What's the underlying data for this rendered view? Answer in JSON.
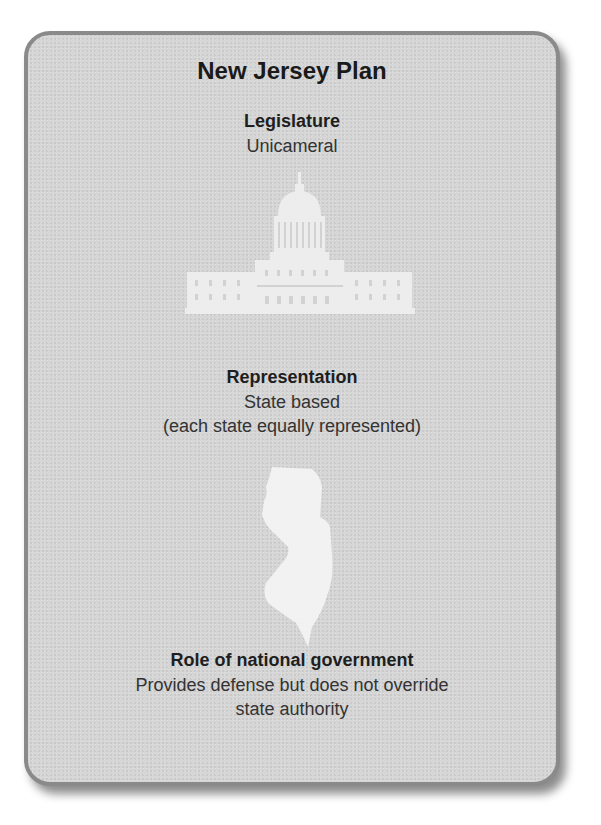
{
  "card": {
    "title": "New Jersey Plan",
    "sections": [
      {
        "heading": "Legislature",
        "lines": [
          "Unicameral"
        ],
        "icon": "capitol-building-icon"
      },
      {
        "heading": "Representation",
        "lines": [
          "State based",
          "(each state equally represented)"
        ],
        "icon": "new-jersey-map-icon"
      },
      {
        "heading": "Role of national government",
        "lines": [
          "Provides defense but does not override",
          "state authority"
        ]
      }
    ]
  },
  "colors": {
    "card_background": "#d6d6d6",
    "card_border": "#8a8a8a",
    "icon_fill": "#f2f2f2",
    "text": "#1e1e1e"
  }
}
